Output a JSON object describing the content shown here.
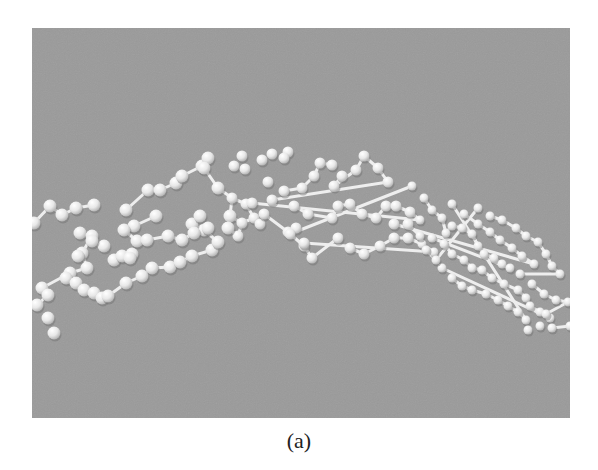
{
  "figure": {
    "caption": "(a)",
    "panel": {
      "x": 32,
      "y": 28,
      "width": 538,
      "height": 390,
      "background": "#9a9a9a"
    },
    "sphere_color": "#f2f2f2",
    "bond_color": "#eeeeee",
    "nodes": [
      [
        2,
        195
      ],
      [
        18,
        178
      ],
      [
        30,
        187
      ],
      [
        44,
        180
      ],
      [
        62,
        177
      ],
      [
        48,
        205
      ],
      [
        72,
        218
      ],
      [
        82,
        232
      ],
      [
        90,
        228
      ],
      [
        100,
        226
      ],
      [
        98,
        230
      ],
      [
        60,
        208
      ],
      [
        50,
        225
      ],
      [
        55,
        240
      ],
      [
        38,
        245
      ],
      [
        10,
        260
      ],
      [
        16,
        267
      ],
      [
        5,
        277
      ],
      [
        34,
        250
      ],
      [
        44,
        255
      ],
      [
        52,
        262
      ],
      [
        62,
        265
      ],
      [
        70,
        270
      ],
      [
        76,
        268
      ],
      [
        94,
        255
      ],
      [
        110,
        248
      ],
      [
        120,
        240
      ],
      [
        138,
        239
      ],
      [
        148,
        234
      ],
      [
        160,
        228
      ],
      [
        180,
        222
      ],
      [
        186,
        214
      ],
      [
        172,
        202
      ],
      [
        160,
        196
      ],
      [
        168,
        188
      ],
      [
        124,
        188
      ],
      [
        102,
        198
      ],
      [
        92,
        202
      ],
      [
        105,
        213
      ],
      [
        115,
        212
      ],
      [
        136,
        208
      ],
      [
        150,
        212
      ],
      [
        162,
        205
      ],
      [
        176,
        200
      ],
      [
        60,
        213
      ],
      [
        46,
        228
      ],
      [
        16,
        290
      ],
      [
        22,
        305
      ],
      [
        94,
        182
      ],
      [
        116,
        162
      ],
      [
        128,
        162
      ],
      [
        144,
        155
      ],
      [
        150,
        148
      ],
      [
        170,
        138
      ],
      [
        176,
        130
      ],
      [
        172,
        140
      ],
      [
        186,
        160
      ],
      [
        200,
        170
      ],
      [
        214,
        176
      ],
      [
        222,
        190
      ],
      [
        210,
        195
      ],
      [
        198,
        188
      ],
      [
        228,
        196
      ],
      [
        206,
        208
      ],
      [
        196,
        200
      ],
      [
        202,
        138
      ],
      [
        213,
        141
      ],
      [
        230,
        132
      ],
      [
        240,
        126
      ],
      [
        256,
        124
      ],
      [
        252,
        130
      ],
      [
        210,
        128
      ],
      [
        236,
        154
      ],
      [
        252,
        163
      ],
      [
        270,
        160
      ],
      [
        282,
        148
      ],
      [
        288,
        135
      ],
      [
        300,
        137
      ],
      [
        310,
        148
      ],
      [
        302,
        158
      ],
      [
        324,
        142
      ],
      [
        332,
        128
      ],
      [
        346,
        140
      ],
      [
        356,
        154
      ],
      [
        240,
        172
      ],
      [
        262,
        178
      ],
      [
        276,
        186
      ],
      [
        300,
        190
      ],
      [
        306,
        178
      ],
      [
        318,
        176
      ],
      [
        330,
        186
      ],
      [
        344,
        190
      ],
      [
        354,
        178
      ],
      [
        364,
        178
      ],
      [
        378,
        184
      ],
      [
        388,
        192
      ],
      [
        220,
        175
      ],
      [
        232,
        186
      ],
      [
        256,
        204
      ],
      [
        272,
        218
      ],
      [
        280,
        230
      ],
      [
        306,
        210
      ],
      [
        318,
        220
      ],
      [
        332,
        226
      ],
      [
        348,
        218
      ],
      [
        362,
        210
      ],
      [
        376,
        210
      ],
      [
        390,
        216
      ],
      [
        402,
        224
      ],
      [
        272,
        215
      ],
      [
        264,
        200
      ],
      [
        258,
        206
      ],
      [
        380,
        158
      ],
      [
        392,
        170
      ],
      [
        400,
        182
      ],
      [
        410,
        190
      ],
      [
        414,
        205
      ],
      [
        420,
        198
      ],
      [
        430,
        200
      ],
      [
        440,
        206
      ],
      [
        446,
        218
      ],
      [
        452,
        226
      ],
      [
        462,
        230
      ],
      [
        470,
        236
      ],
      [
        478,
        240
      ],
      [
        400,
        210
      ],
      [
        412,
        216
      ],
      [
        420,
        226
      ],
      [
        432,
        232
      ],
      [
        440,
        240
      ],
      [
        450,
        242
      ],
      [
        460,
        250
      ],
      [
        472,
        256
      ],
      [
        486,
        262
      ],
      [
        494,
        270
      ],
      [
        498,
        278
      ],
      [
        508,
        284
      ],
      [
        518,
        290
      ],
      [
        410,
        240
      ],
      [
        420,
        250
      ],
      [
        430,
        258
      ],
      [
        440,
        262
      ],
      [
        454,
        266
      ],
      [
        466,
        272
      ],
      [
        476,
        278
      ],
      [
        486,
        284
      ],
      [
        494,
        292
      ],
      [
        420,
        176
      ],
      [
        432,
        186
      ],
      [
        446,
        196
      ],
      [
        458,
        204
      ],
      [
        468,
        212
      ],
      [
        480,
        220
      ],
      [
        490,
        228
      ],
      [
        502,
        236
      ],
      [
        362,
        196
      ],
      [
        376,
        196
      ],
      [
        388,
        208
      ],
      [
        394,
        222
      ],
      [
        404,
        232
      ],
      [
        446,
        180
      ],
      [
        458,
        188
      ],
      [
        470,
        192
      ],
      [
        484,
        200
      ],
      [
        494,
        208
      ],
      [
        506,
        214
      ],
      [
        514,
        226
      ],
      [
        520,
        238
      ],
      [
        528,
        246
      ],
      [
        488,
        246
      ],
      [
        500,
        256
      ],
      [
        512,
        266
      ],
      [
        524,
        272
      ],
      [
        536,
        274
      ],
      [
        514,
        286
      ],
      [
        520,
        300
      ],
      [
        538,
        298
      ],
      [
        496,
        302
      ],
      [
        508,
        298
      ]
    ],
    "bonds": [
      [
        0,
        1
      ],
      [
        1,
        2
      ],
      [
        2,
        3
      ],
      [
        3,
        4
      ],
      [
        5,
        11
      ],
      [
        11,
        12
      ],
      [
        12,
        13
      ],
      [
        13,
        14
      ],
      [
        14,
        15
      ],
      [
        15,
        16
      ],
      [
        16,
        17
      ],
      [
        18,
        19
      ],
      [
        19,
        20
      ],
      [
        20,
        21
      ],
      [
        21,
        22
      ],
      [
        22,
        23
      ],
      [
        23,
        24
      ],
      [
        24,
        25
      ],
      [
        25,
        26
      ],
      [
        26,
        27
      ],
      [
        27,
        28
      ],
      [
        28,
        29
      ],
      [
        29,
        30
      ],
      [
        30,
        31
      ],
      [
        31,
        32
      ],
      [
        32,
        33
      ],
      [
        33,
        34
      ],
      [
        35,
        36
      ],
      [
        36,
        37
      ],
      [
        37,
        38
      ],
      [
        38,
        39
      ],
      [
        39,
        40
      ],
      [
        40,
        41
      ],
      [
        41,
        42
      ],
      [
        42,
        43
      ],
      [
        48,
        49
      ],
      [
        49,
        50
      ],
      [
        50,
        51
      ],
      [
        51,
        52
      ],
      [
        52,
        53
      ],
      [
        53,
        54
      ],
      [
        55,
        56
      ],
      [
        56,
        57
      ],
      [
        57,
        58
      ],
      [
        58,
        59
      ],
      [
        59,
        60
      ],
      [
        60,
        61
      ],
      [
        61,
        57
      ],
      [
        59,
        62
      ],
      [
        60,
        63
      ],
      [
        63,
        64
      ],
      [
        73,
        74
      ],
      [
        74,
        75
      ],
      [
        75,
        76
      ],
      [
        76,
        77
      ],
      [
        78,
        79
      ],
      [
        79,
        80
      ],
      [
        80,
        81
      ],
      [
        81,
        82
      ],
      [
        82,
        83
      ],
      [
        83,
        84
      ],
      [
        85,
        86
      ],
      [
        86,
        87
      ],
      [
        87,
        88
      ],
      [
        88,
        89
      ],
      [
        89,
        90
      ],
      [
        90,
        91
      ],
      [
        91,
        92
      ],
      [
        92,
        93
      ],
      [
        93,
        94
      ],
      [
        94,
        95
      ],
      [
        95,
        96
      ],
      [
        97,
        98
      ],
      [
        98,
        99
      ],
      [
        99,
        100
      ],
      [
        100,
        101
      ],
      [
        102,
        103
      ],
      [
        103,
        104
      ],
      [
        104,
        105
      ],
      [
        105,
        106
      ],
      [
        106,
        107
      ],
      [
        107,
        108
      ],
      [
        108,
        109
      ],
      [
        110,
        111
      ],
      [
        111,
        112
      ],
      [
        113,
        114
      ],
      [
        114,
        115
      ],
      [
        115,
        116
      ],
      [
        116,
        117
      ],
      [
        117,
        118
      ],
      [
        118,
        119
      ],
      [
        119,
        120
      ],
      [
        120,
        121
      ],
      [
        121,
        122
      ],
      [
        122,
        123
      ],
      [
        123,
        124
      ],
      [
        124,
        125
      ],
      [
        126,
        127
      ],
      [
        127,
        128
      ],
      [
        128,
        129
      ],
      [
        129,
        130
      ],
      [
        130,
        131
      ],
      [
        131,
        132
      ],
      [
        132,
        133
      ],
      [
        133,
        134
      ],
      [
        134,
        135
      ],
      [
        135,
        136
      ],
      [
        136,
        137
      ],
      [
        137,
        138
      ],
      [
        139,
        140
      ],
      [
        140,
        141
      ],
      [
        141,
        142
      ],
      [
        142,
        143
      ],
      [
        143,
        144
      ],
      [
        144,
        145
      ],
      [
        145,
        146
      ],
      [
        146,
        147
      ],
      [
        148,
        149
      ],
      [
        149,
        150
      ],
      [
        150,
        151
      ],
      [
        151,
        152
      ],
      [
        152,
        153
      ],
      [
        153,
        154
      ],
      [
        154,
        155
      ],
      [
        156,
        157
      ],
      [
        157,
        158
      ],
      [
        158,
        159
      ],
      [
        159,
        160
      ],
      [
        161,
        162
      ],
      [
        162,
        163
      ],
      [
        163,
        164
      ],
      [
        164,
        165
      ],
      [
        165,
        166
      ],
      [
        166,
        167
      ],
      [
        167,
        168
      ],
      [
        168,
        169
      ],
      [
        170,
        171
      ],
      [
        171,
        172
      ],
      [
        172,
        173
      ],
      [
        173,
        174
      ],
      [
        175,
        176
      ],
      [
        178,
        179
      ]
    ]
  }
}
